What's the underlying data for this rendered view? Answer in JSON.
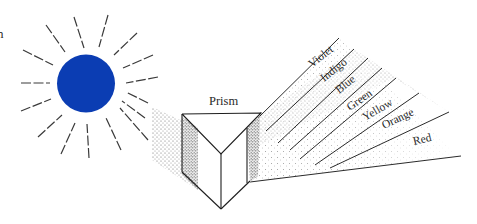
{
  "diagram": {
    "title_fragment": "n",
    "sun": {
      "label": "sun",
      "color": "#0b3db3",
      "center": [
        86,
        83
      ],
      "radius": 29
    },
    "prism": {
      "label": "Prism"
    },
    "spectrum": {
      "colors": [
        {
          "name": "Violet",
          "x": 322,
          "y": 65
        },
        {
          "name": "Indigo",
          "x": 336,
          "y": 76
        },
        {
          "name": "Blue",
          "x": 348,
          "y": 90
        },
        {
          "name": "Green",
          "x": 362,
          "y": 100
        },
        {
          "name": "Yellow",
          "x": 380,
          "y": 111
        },
        {
          "name": "Orange",
          "x": 404,
          "y": 125
        },
        {
          "name": "Red",
          "x": 422,
          "y": 145
        }
      ],
      "label_rotation_deg": -35
    }
  }
}
